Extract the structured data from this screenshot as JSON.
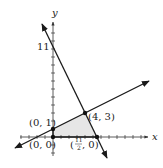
{
  "diagram": {
    "type": "linear-programming-feasible-region",
    "axes": {
      "x_label": "x",
      "y_label": "y",
      "y_intercept_label": "11"
    },
    "vertices": [
      {
        "label": "(0, 0)",
        "x": 0,
        "y": 0
      },
      {
        "label": "(0, 1)",
        "x": 0,
        "y": 1
      },
      {
        "label": "(4, 3)",
        "x": 4,
        "y": 3
      },
      {
        "label_numerator": "11",
        "label_denominator": "2",
        "label_prefix": "(",
        "label_suffix": ", 0)",
        "x": 5.5,
        "y": 0
      }
    ],
    "lines": [
      {
        "name": "shallow-line",
        "through": [
          [
            0,
            1
          ],
          [
            4,
            3
          ]
        ]
      },
      {
        "name": "steep-line",
        "through": [
          [
            0,
            11
          ],
          [
            5.5,
            0
          ]
        ]
      }
    ],
    "colors": {
      "line": "#1a1a1a",
      "shade": "#e6e6e6",
      "axis": "#333333"
    }
  }
}
